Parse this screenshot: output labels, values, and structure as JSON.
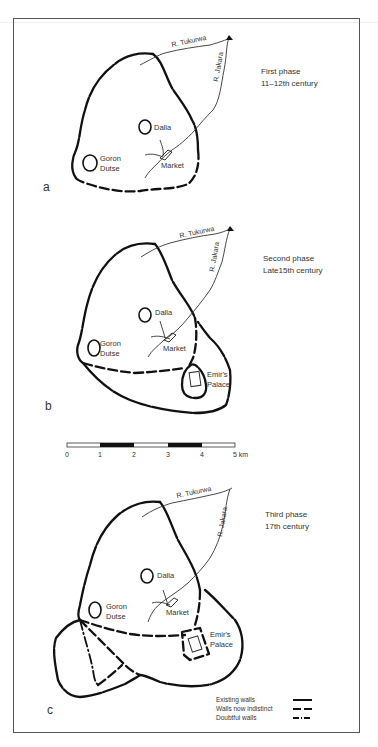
{
  "figure": {
    "panels": [
      {
        "letter": "a",
        "phase_title": "First phase",
        "phase_period": "11–12th century",
        "labels": {
          "river_tukurwa": "R. Tukurwa",
          "river_jakara": "R. Jakara",
          "dalla": "Dalla",
          "goron1": "Goron",
          "goron2": "Dutse",
          "market": "Market"
        }
      },
      {
        "letter": "b",
        "phase_title": "Second phase",
        "phase_period": "Late15th century",
        "labels": {
          "river_tukurwa": "R. Tukurwa",
          "river_jakara": "R. Jakara",
          "dalla": "Dalla",
          "goron1": "Goron",
          "goron2": "Dutse",
          "market": "Market",
          "emir1": "Emir's",
          "emir2": "Palace"
        }
      },
      {
        "letter": "c",
        "phase_title": "Third phase",
        "phase_period": "17th century",
        "labels": {
          "river_tukurwa": "R. Tukurwa",
          "river_jakara": "R. Jakara",
          "dalla": "Dalla",
          "goron1": "Goron",
          "goron2": "Dutse",
          "market": "Market",
          "emir1": "Emir's",
          "emir2": "Palace"
        }
      }
    ],
    "scale_bar": {
      "ticks": [
        "0",
        "1",
        "2",
        "3",
        "4",
        "5 km"
      ]
    },
    "legend": {
      "items": [
        {
          "label": "Existing walls",
          "style": "solid"
        },
        {
          "label": "Walls now indistinct",
          "style": "dashed"
        },
        {
          "label": "Doubtful walls",
          "style": "dash-dot"
        }
      ]
    }
  }
}
